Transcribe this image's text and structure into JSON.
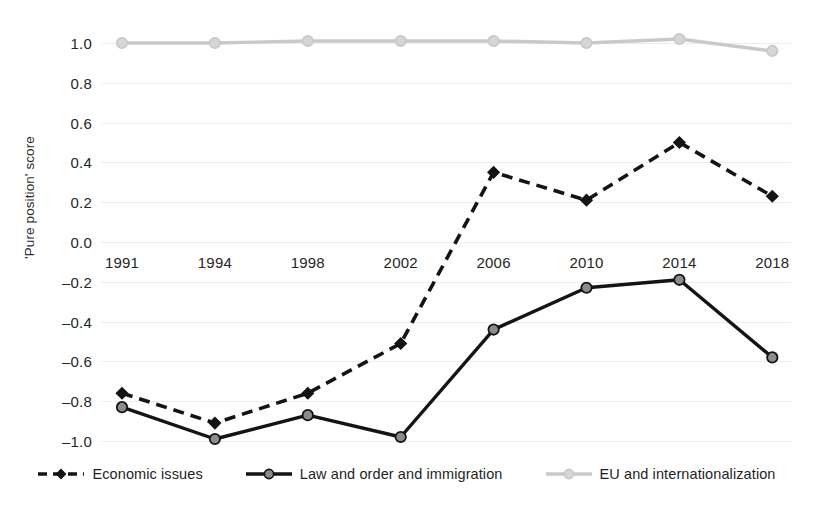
{
  "chart_data": {
    "type": "line",
    "title": "",
    "xlabel": "",
    "ylabel": "'Pure position' score",
    "categories": [
      "1991",
      "1994",
      "1998",
      "2002",
      "2006",
      "2010",
      "2014",
      "2018"
    ],
    "ylim": [
      -1.0,
      1.0
    ],
    "ytick_labels": [
      "1.0",
      "0.8",
      "0.6",
      "0.4",
      "0.2",
      "0.0",
      "–0.2",
      "–0.4",
      "–0.6",
      "–0.8",
      "–1.0"
    ],
    "ytick_values": [
      1.0,
      0.8,
      0.6,
      0.4,
      0.2,
      0.0,
      -0.2,
      -0.4,
      -0.6,
      -0.8,
      -1.0
    ],
    "grid": true,
    "legend_position": "bottom",
    "series": [
      {
        "name": "Economic issues",
        "values": [
          -0.76,
          -0.91,
          -0.76,
          -0.51,
          0.35,
          0.21,
          0.5,
          0.23
        ],
        "color": "#141414",
        "style": "dashed",
        "marker": "diamond"
      },
      {
        "name": "Law and order and immigration",
        "values": [
          -0.83,
          -0.99,
          -0.87,
          -0.98,
          -0.44,
          -0.23,
          -0.19,
          -0.58
        ],
        "color": "#141414",
        "style": "solid",
        "marker": "circle",
        "marker_fill": "#8c8c8c"
      },
      {
        "name": "EU and internationalization",
        "values": [
          1.0,
          1.0,
          1.01,
          1.01,
          1.01,
          1.0,
          1.02,
          0.96
        ],
        "color": "#c9c9c9",
        "style": "solid",
        "marker": "circle",
        "marker_fill": "#d6d6d6"
      }
    ]
  },
  "axis": {
    "y_title": "'Pure position' score"
  },
  "legend": {
    "items": [
      {
        "label": "Economic issues"
      },
      {
        "label": "Law and order and immigration"
      },
      {
        "label": "EU and internationalization"
      }
    ]
  }
}
